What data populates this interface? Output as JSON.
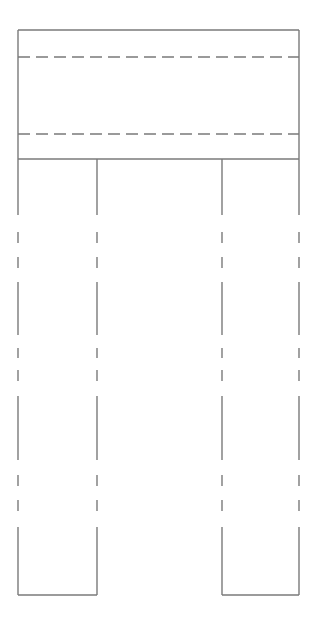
{
  "diagram": {
    "type": "technical-line-drawing",
    "canvas": {
      "width": 316,
      "height": 621,
      "background": "#ffffff"
    },
    "stroke": {
      "color": "#7a7a7a",
      "width": 1.4
    },
    "top_block": {
      "x1": 18,
      "y1": 30,
      "x2": 299,
      "y2": 159
    },
    "hidden_lines_horizontal": [
      {
        "y": 57,
        "x1": 18,
        "x2": 299,
        "dash": "12 6"
      },
      {
        "y": 134,
        "x1": 18,
        "x2": 299,
        "dash": "12 6"
      }
    ],
    "legs": [
      {
        "name": "left-leg",
        "x_outer": 18,
        "x_inner": 97,
        "y_top": 159,
        "y_bottom": 595
      },
      {
        "name": "right-leg",
        "x_inner": 222,
        "x_outer": 299,
        "y_top": 159,
        "y_bottom": 595
      }
    ],
    "leg_edge_segments": [
      [
        159,
        215
      ],
      [
        232,
        243
      ],
      [
        257,
        268
      ],
      [
        282,
        335
      ],
      [
        348,
        358
      ],
      [
        370,
        381
      ],
      [
        396,
        460
      ],
      [
        475,
        486
      ],
      [
        500,
        511
      ],
      [
        527,
        595
      ]
    ]
  }
}
